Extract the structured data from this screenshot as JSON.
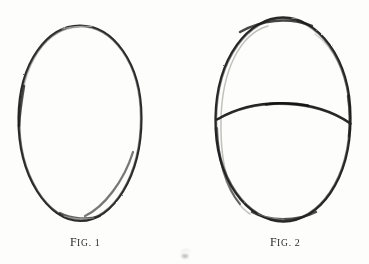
{
  "plate": {
    "title": "Two hand-drawn egg-shape outlines (head construction diagram)",
    "background_color": "#fdfdfc",
    "ink_color": "#262626",
    "faint_ink_color": "#9a9a96",
    "medium": "pencil drawing on paper, halftone scan"
  },
  "figures": [
    {
      "id": "fig-1",
      "caption_lead": "F",
      "caption_smallcaps": "IG",
      "caption_dot": ".",
      "caption_number": "1",
      "caption_full": "FIG. 1",
      "shape": "egg-outline",
      "description": "single closed egg / oval outline, wider at the bottom, drawn with a soft pencil line",
      "bbox": {
        "x": 18,
        "y": 25,
        "width": 124,
        "height": 196
      },
      "center": {
        "cx": 80,
        "cy": 123
      },
      "radii": {
        "rx": 62,
        "ry": 98
      },
      "stroke_width": 2.1,
      "has_cross_curve": false,
      "has_ghost_line": true
    },
    {
      "id": "fig-2",
      "caption_lead": "F",
      "caption_smallcaps": "IG",
      "caption_dot": ".",
      "caption_number": "2",
      "caption_full": "FIG. 2",
      "shape": "egg-outline-with-brow-line",
      "description": "egg outline of the same proportions crossed by an upward-bowing horizontal construction curve about 45% down, with a faint duplicate outline on the left and upper-right",
      "bbox": {
        "x": 215,
        "y": 17,
        "width": 136,
        "height": 205
      },
      "center": {
        "cx": 283,
        "cy": 119
      },
      "radii": {
        "rx": 68,
        "ry": 102
      },
      "stroke_width": 2.3,
      "has_cross_curve": true,
      "has_ghost_line": true,
      "cross_curve": {
        "label": "brow-line",
        "start": {
          "x": 217,
          "y": 119
        },
        "peak": {
          "x": 285,
          "y": 104
        },
        "end": {
          "x": 350,
          "y": 123
        },
        "stroke_width": 2.6
      }
    }
  ],
  "marks": {
    "bottom_smudge": "faint ink mark at the bottom centre of the plate"
  }
}
